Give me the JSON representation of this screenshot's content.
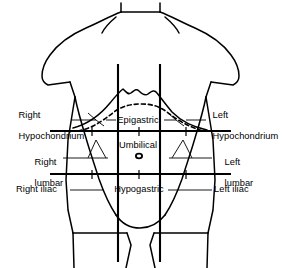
{
  "figure": {
    "line_color": "#000000",
    "background_color": "#ffffff",
    "text_color": "#000000"
  },
  "regions": {
    "right_hypochondrium": {
      "line1": "Right",
      "line2": "Hypochondrium"
    },
    "epigastric": {
      "label": "Epigastric"
    },
    "left_hypochondrium": {
      "line1": "Left",
      "line2": "Hypochondrium"
    },
    "right_lumbar": {
      "line1": "Right",
      "line2": "lumbar"
    },
    "umbilical": {
      "label": "Umbilical"
    },
    "left_lumbar": {
      "line1": "Left",
      "line2": "lumbar"
    },
    "right_iliac": {
      "label": "Right iliac"
    },
    "hypogastric": {
      "label": "Hypogastric"
    },
    "left_iliac": {
      "label": "Left iliac"
    }
  },
  "anatomy": {
    "umbilicus_marker": "navel-oval",
    "diaphragm": "dashed-curve",
    "costal_margin": "solid-curve"
  },
  "planes": {
    "vertical_left_x": 118,
    "vertical_right_x": 160,
    "horizontal_subcostal_y": 131,
    "horizontal_intertubercular_y": 174
  }
}
